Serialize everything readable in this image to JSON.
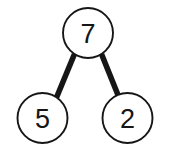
{
  "diagram": {
    "type": "binary-tree",
    "background_color": "#ffffff",
    "node_fill_color": "#ffffff",
    "node_stroke_color": "#161616",
    "edge_color": "#161616",
    "label_color": "#161616",
    "nodes": [
      {
        "id": "root",
        "label": "7",
        "role": "root",
        "cx": 88,
        "cy": 33,
        "r": 25
      },
      {
        "id": "left",
        "label": "5",
        "role": "left-child",
        "cx": 42.5,
        "cy": 118,
        "r": 25
      },
      {
        "id": "right",
        "label": "2",
        "role": "right-child",
        "cx": 127.5,
        "cy": 118,
        "r": 25
      }
    ],
    "edges": [
      {
        "id": "root-left",
        "from": "root",
        "to": "left",
        "x1": 74.5,
        "y1": 54.0,
        "x2": 56.5,
        "y2": 97.5
      },
      {
        "id": "root-right",
        "from": "root",
        "to": "right",
        "x1": 101.5,
        "y1": 54.0,
        "x2": 119.0,
        "y2": 97.5
      }
    ]
  }
}
